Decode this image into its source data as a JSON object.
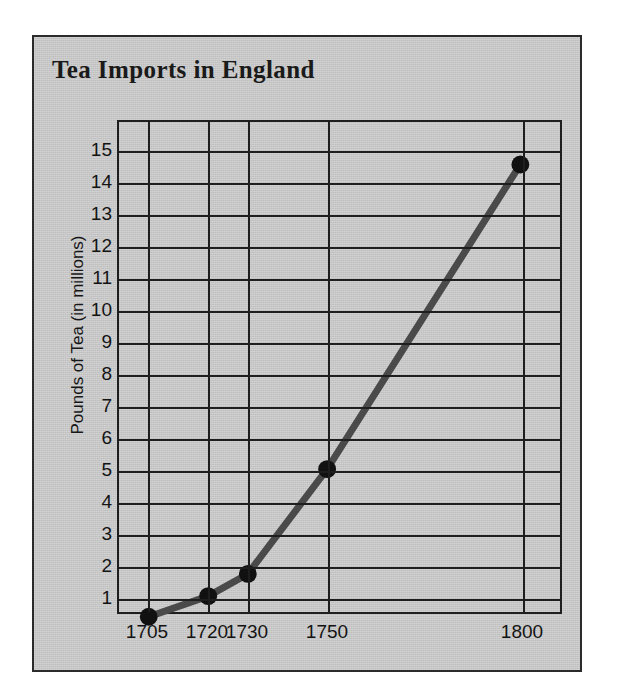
{
  "chart_data": {
    "type": "line",
    "title": "Tea Imports in England",
    "xlabel": "",
    "ylabel": "Pounds of Tea (in millions)",
    "x": [
      1705,
      1720,
      1730,
      1750,
      1800
    ],
    "xtick_labels": [
      "1705",
      "1720",
      "1730",
      "1750",
      "1800"
    ],
    "values": [
      0.35,
      1.0,
      1.7,
      5.0,
      14.6
    ],
    "ytick_labels": [
      "15",
      "14",
      "13",
      "12",
      "11",
      "10",
      "9",
      "8",
      "7",
      "6",
      "5",
      "4",
      "3",
      "2",
      "1"
    ],
    "yticks": [
      15,
      14,
      13,
      12,
      11,
      10,
      9,
      8,
      7,
      6,
      5,
      4,
      3,
      2,
      1
    ],
    "ylim": [
      0,
      15.5
    ],
    "grid": true,
    "legend": false,
    "series_color": "#4a4a4a",
    "marker_color": "#111111",
    "axis_color": "#1e1e1e",
    "panel_color": "#c9c9c9"
  }
}
